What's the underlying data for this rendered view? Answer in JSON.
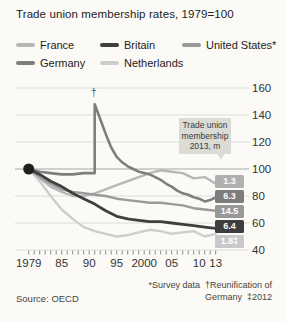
{
  "title": "Trade union membership rates, 1979=100",
  "legend": {
    "items": [
      {
        "label": "France",
        "series": 0
      },
      {
        "label": "Britain",
        "series": 4
      },
      {
        "label": "United States*",
        "series": 2
      },
      {
        "label": "Germany",
        "series": 3
      },
      {
        "label": "Netherlands",
        "series": 1
      }
    ]
  },
  "callout": {
    "text": "Trade union\nmembership\n2013, m"
  },
  "annotations": {
    "reunification_marker": "†"
  },
  "footer": {
    "source": "Source: OECD",
    "footnote_line1": "*Survey data  †Reunification of",
    "footnote_line2": "Germany  ‡2012"
  },
  "chart_data": {
    "type": "line",
    "title": "Trade union membership rates, 1979=100",
    "xlabel": "",
    "ylabel": "Index, 1979=100",
    "x_axis": {
      "range": [
        1979,
        2013
      ],
      "label_ticks": [
        "1979",
        "85",
        "90",
        "95",
        "2000",
        "05",
        "10",
        "13"
      ],
      "label_tick_years": [
        1979,
        1985,
        1990,
        1995,
        2000,
        2005,
        2010,
        2013
      ],
      "minor_ticks": "every year 1979-2013"
    },
    "y_axis": {
      "range": [
        40,
        160
      ],
      "ticks": [
        40,
        60,
        80,
        100,
        120,
        140,
        160
      ],
      "baseline_value": 100,
      "grid": true
    },
    "legend_position": "top",
    "start_marker": {
      "year": 1979,
      "value": 100,
      "style": "large black dot"
    },
    "annotation": {
      "text": "†",
      "year": 1991,
      "meaning": "Reunification of Germany",
      "value_at_peak": 148
    },
    "callout_label": "Trade union membership 2013, m",
    "series": [
      {
        "name": "France",
        "color": "#b7b7b7",
        "badge_color": "#b0b0b0",
        "badge": "1.3",
        "membership_2013_m": "1.3",
        "width": 2.4,
        "x": [
          1979,
          1981,
          1983,
          1985,
          1987,
          1989,
          1991,
          1993,
          1995,
          1997,
          1999,
          2001,
          2003,
          2005,
          2007,
          2009,
          2011,
          2013
        ],
        "y": [
          100,
          93,
          87,
          83,
          80,
          80,
          82,
          85,
          88,
          91,
          94,
          97,
          99,
          98,
          97,
          93,
          94,
          89
        ]
      },
      {
        "name": "Netherlands",
        "color": "#cdcdcd",
        "badge_color": "#c9c9c9",
        "badge": "1.8‡",
        "membership_2012_m": "1.8",
        "width": 2.4,
        "x": [
          1979,
          1981,
          1983,
          1985,
          1987,
          1989,
          1991,
          1993,
          1995,
          1997,
          1999,
          2001,
          2003,
          2005,
          2007,
          2009,
          2011,
          2013
        ],
        "y": [
          100,
          91,
          80,
          70,
          63,
          57,
          54,
          52,
          50,
          51,
          53,
          55,
          54,
          52,
          53,
          54,
          50,
          52
        ]
      },
      {
        "name": "United States",
        "color": "#9a9a9a",
        "badge_color": "#989898",
        "badge": "14.5",
        "membership_2013_m": "14.5",
        "width": 2.4,
        "x": [
          1979,
          1981,
          1983,
          1985,
          1987,
          1989,
          1991,
          1993,
          1995,
          1997,
          1999,
          2001,
          2003,
          2005,
          2007,
          2009,
          2011,
          2013
        ],
        "y": [
          100,
          94,
          89,
          85,
          83,
          82,
          81,
          80,
          78,
          77,
          76,
          75,
          75,
          74,
          73,
          71,
          70,
          69
        ]
      },
      {
        "name": "Germany",
        "color": "#7e7e7e",
        "badge_color": "#7d7d7d",
        "badge": "6.3",
        "membership_2013_m": "6.3",
        "width": 2.6,
        "x": [
          1979,
          1981,
          1983,
          1985,
          1987,
          1989,
          1990,
          1991,
          1991,
          1992,
          1993,
          1994,
          1995,
          1996,
          1997,
          1998,
          1999,
          2000,
          2001,
          2002,
          2003,
          2004,
          2005,
          2006,
          2007,
          2008,
          2009,
          2010,
          2011,
          2012,
          2013
        ],
        "y": [
          100,
          98,
          97,
          96,
          96,
          97,
          97,
          97,
          148,
          137,
          126,
          116,
          109,
          105,
          102,
          100,
          98,
          97,
          96,
          94,
          92,
          89,
          87,
          84,
          82,
          81,
          79,
          78,
          76,
          77,
          79
        ]
      },
      {
        "name": "Britain",
        "color": "#3f3f3f",
        "badge_color": "#3d3d3d",
        "badge": "6.4",
        "membership_2013_m": "6.4",
        "width": 2.8,
        "x": [
          1979,
          1981,
          1983,
          1985,
          1987,
          1989,
          1991,
          1993,
          1995,
          1997,
          1999,
          2001,
          2003,
          2005,
          2007,
          2009,
          2011,
          2013
        ],
        "y": [
          100,
          96,
          91,
          87,
          82,
          78,
          74,
          69,
          65,
          63,
          62,
          61,
          61,
          60,
          59,
          58,
          57,
          56
        ]
      }
    ]
  }
}
